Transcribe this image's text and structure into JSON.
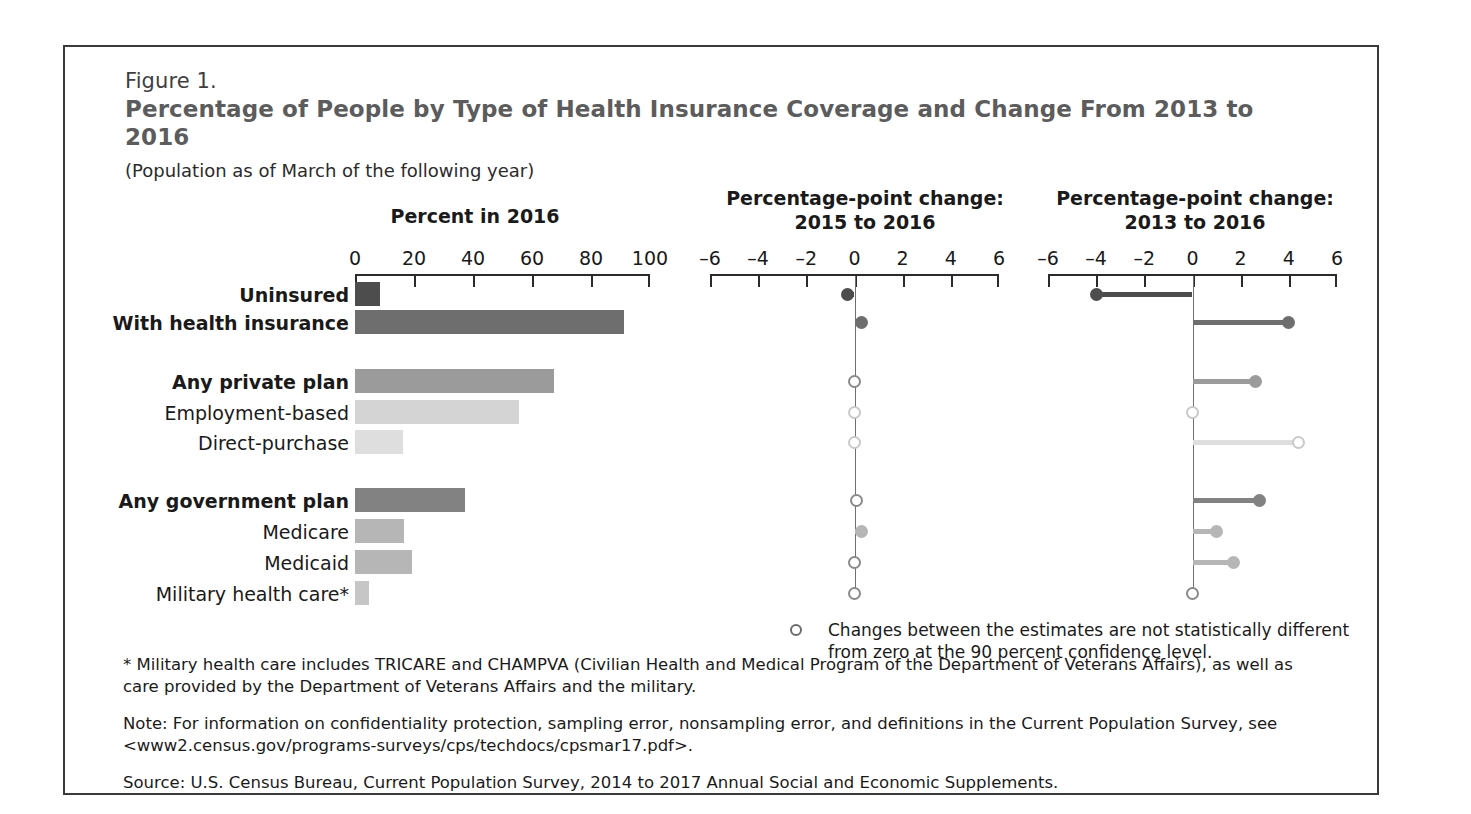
{
  "figure": {
    "number": "Figure 1.",
    "title": "Percentage of People by Type of Health Insurance Coverage and Change From 2013 to 2016",
    "subtitle": "(Population as of March of the following year)"
  },
  "panels": {
    "left": {
      "header": "Percent in 2016",
      "ticks": [
        "0",
        "20",
        "40",
        "60",
        "80",
        "100"
      ],
      "min": 0,
      "max": 100
    },
    "mid": {
      "header_line1": "Percentage-point change:",
      "header_line2": "2015 to 2016",
      "ticks": [
        "–6",
        "–4",
        "–2",
        "0",
        "2",
        "4",
        "6"
      ],
      "min": -6,
      "max": 6
    },
    "right": {
      "header_line1": "Percentage-point change:",
      "header_line2": "2013 to 2016",
      "ticks": [
        "–6",
        "–4",
        "–2",
        "0",
        "2",
        "4",
        "6"
      ],
      "min": -6,
      "max": 6
    }
  },
  "legend": {
    "marker": "open-circle-marker",
    "text": "Changes between the estimates are not statistically different from zero at the 90 percent confidence level."
  },
  "footnotes": {
    "military": "* Military health care includes TRICARE and CHAMPVA (Civilian Health and Medical Program of the Department of Veterans Affairs), as well as care provided by the Department of Veterans Affairs and the military.",
    "note": "Note: For information on confidentiality protection, sampling error, nonsampling error, and definitions in the Current Population Survey, see <www2.census.gov/programs-surveys/cps/techdocs/cpsmar17.pdf>.",
    "source": "Source: U.S. Census Bureau, Current Population Survey, 2014 to 2017 Annual Social and Economic Supplements."
  },
  "colors": {
    "uninsured": "#4d4d4d",
    "with_insurance": "#6e6e6e",
    "any_private": "#9b9b9b",
    "employment_based": "#d4d4d4",
    "direct_purchase": "#dedede",
    "any_government": "#828282",
    "medicare": "#b6b6b6",
    "medicaid": "#b6b6b6",
    "military": "#c6c6c6",
    "frame": "#3a3a3a",
    "title": "#5c5c5c",
    "axis": "#2b2b2b"
  },
  "chart_data": {
    "type": "bar",
    "title": "Percentage of People by Type of Health Insurance Coverage and Change From 2013 to 2016",
    "subtitle": "(Population as of March of the following year)",
    "xlabel": "",
    "ylabel": "",
    "grid": false,
    "legend_position": "below-right",
    "categories": [
      "Uninsured",
      "With health insurance",
      "Any private plan",
      "Employment-based",
      "Direct-purchase",
      "Any government plan",
      "Medicare",
      "Medicaid",
      "Military health care*"
    ],
    "series": [
      {
        "name": "Percent in 2016",
        "panel": "left",
        "xlim": [
          0,
          100
        ],
        "values": [
          8.6,
          91.2,
          67.5,
          55.7,
          16.2,
          37.3,
          16.7,
          19.4,
          4.6
        ]
      },
      {
        "name": "Percentage-point change: 2015 to 2016",
        "panel": "mid",
        "xlim": [
          -6,
          6
        ],
        "values": [
          -0.3,
          0.3,
          0.0,
          0.0,
          0.0,
          0.1,
          0.3,
          0.0,
          0.0
        ],
        "significant": [
          true,
          true,
          false,
          false,
          false,
          false,
          true,
          false,
          false
        ]
      },
      {
        "name": "Percentage-point change: 2013 to 2016",
        "panel": "right",
        "xlim": [
          -6,
          6
        ],
        "values": [
          -4.0,
          4.0,
          2.6,
          0.0,
          4.4,
          2.8,
          1.0,
          1.7,
          0.0
        ],
        "significant": [
          true,
          true,
          true,
          false,
          false,
          true,
          true,
          true,
          false
        ]
      }
    ]
  },
  "rows": [
    {
      "label": "Uninsured",
      "bold": true,
      "group": 0,
      "color_key": "uninsured",
      "left": 8.6,
      "mid": -0.3,
      "mid_sig": true,
      "right": -4.0,
      "right_sig": true
    },
    {
      "label": "With health insurance",
      "bold": true,
      "group": 0,
      "color_key": "with_insurance",
      "left": 91.2,
      "mid": 0.3,
      "mid_sig": true,
      "right": 4.0,
      "right_sig": true
    },
    {
      "label": "Any private plan",
      "bold": true,
      "group": 1,
      "color_key": "any_private",
      "left": 67.5,
      "mid": 0.0,
      "mid_sig": false,
      "right": 2.6,
      "right_sig": true
    },
    {
      "label": "Employment-based",
      "bold": false,
      "group": 1,
      "color_key": "employment_based",
      "left": 55.7,
      "mid": 0.0,
      "mid_sig": false,
      "right": 0.0,
      "right_sig": false
    },
    {
      "label": "Direct-purchase",
      "bold": false,
      "group": 1,
      "color_key": "direct_purchase",
      "left": 16.2,
      "mid": 0.0,
      "mid_sig": false,
      "right": 4.4,
      "right_sig": false
    },
    {
      "label": "Any government plan",
      "bold": true,
      "group": 2,
      "color_key": "any_government",
      "left": 37.3,
      "mid": 0.1,
      "mid_sig": false,
      "right": 2.8,
      "right_sig": true
    },
    {
      "label": "Medicare",
      "bold": false,
      "group": 2,
      "color_key": "medicare",
      "left": 16.7,
      "mid": 0.3,
      "mid_sig": true,
      "right": 1.0,
      "right_sig": true
    },
    {
      "label": "Medicaid",
      "bold": false,
      "group": 2,
      "color_key": "medicaid",
      "left": 19.4,
      "mid": 0.0,
      "mid_sig": false,
      "right": 1.7,
      "right_sig": true
    },
    {
      "label": "Military health care*",
      "bold": false,
      "group": 2,
      "color_key": "military",
      "left": 4.6,
      "mid": 0.0,
      "mid_sig": false,
      "right": 0.0,
      "right_sig": false
    }
  ],
  "geometry": {
    "row_y": [
      280,
      308,
      367,
      398,
      428,
      486,
      517,
      548,
      579
    ],
    "left_axis": {
      "x0": 353,
      "x1": 648,
      "y": 272
    },
    "mid_axis": {
      "x0": 708,
      "x1": 997,
      "y": 272
    },
    "right_axis": {
      "x0": 1046,
      "x1": 1335,
      "y": 272
    }
  }
}
